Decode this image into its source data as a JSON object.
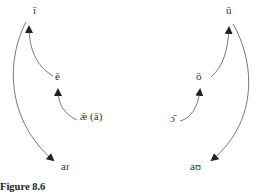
{
  "figure": {
    "caption": "Figure 8.6"
  },
  "front_vowels": {
    "high": "ī",
    "mid": "ē",
    "low": "ǣ (ā)",
    "diphthong": "aɪ"
  },
  "back_vowels": {
    "high": "ū",
    "mid": "ō",
    "low": "ɔ̄",
    "diphthong": "aʊ"
  },
  "arrows": [
    {
      "from": "ǣ (ā)",
      "to": "ē"
    },
    {
      "from": "ē",
      "to": "ī"
    },
    {
      "from": "ī",
      "to": "aɪ"
    },
    {
      "from": "ɔ̄",
      "to": "ō"
    },
    {
      "from": "ō",
      "to": "ū"
    },
    {
      "from": "ū",
      "to": "aʊ"
    }
  ],
  "colors": {
    "line": "#555555",
    "text": "#333333"
  }
}
